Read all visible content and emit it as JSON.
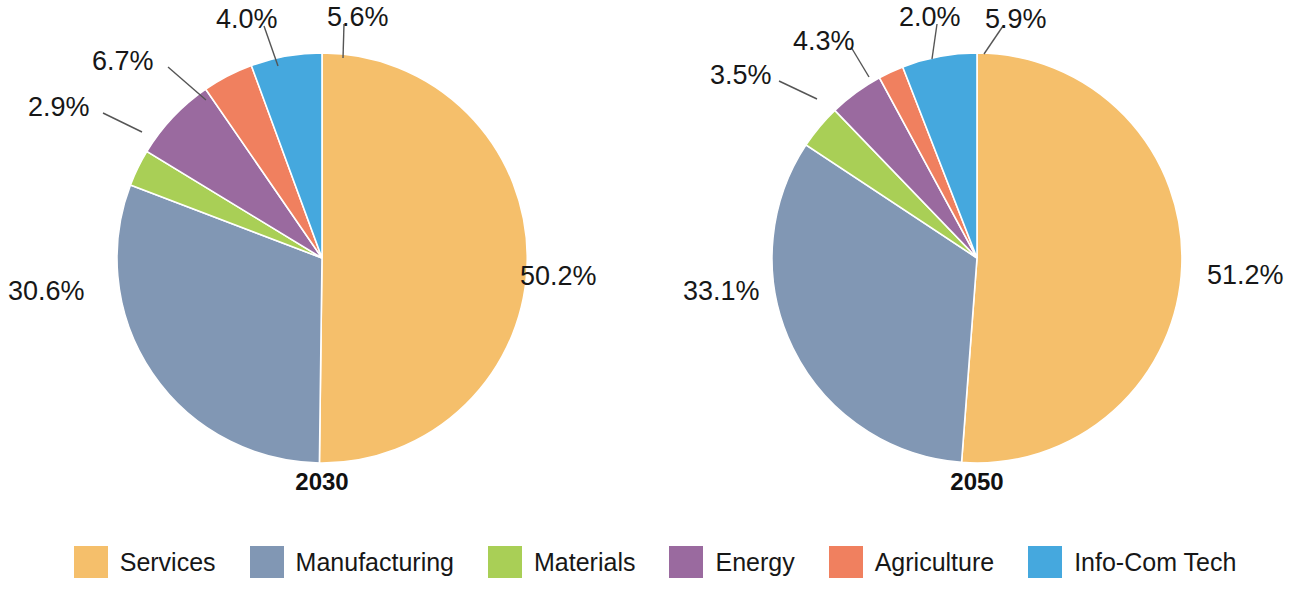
{
  "chart_data": [
    {
      "type": "pie",
      "title": "2030",
      "categories": [
        "Services",
        "Manufacturing",
        "Materials",
        "Energy",
        "Agriculture",
        "Info-Com Tech"
      ],
      "values": [
        50.2,
        30.6,
        2.9,
        6.7,
        4.0,
        5.6
      ],
      "value_labels": [
        "50.2%",
        "30.6%",
        "2.9%",
        "6.7%",
        "4.0%",
        "5.6%"
      ],
      "colors": [
        "#F5BF6B",
        "#8197B4",
        "#A9CF56",
        "#9A6A9F",
        "#F0805F",
        "#45A8DE"
      ],
      "legend_position": "bottom",
      "grid": false
    },
    {
      "type": "pie",
      "title": "2050",
      "categories": [
        "Services",
        "Manufacturing",
        "Materials",
        "Energy",
        "Agriculture",
        "Info-Com Tech"
      ],
      "values": [
        51.2,
        33.1,
        3.5,
        4.3,
        2.0,
        5.9
      ],
      "value_labels": [
        "51.2%",
        "33.1%",
        "3.5%",
        "4.3%",
        "2.0%",
        "5.9%"
      ],
      "colors": [
        "#F5BF6B",
        "#8197B4",
        "#A9CF56",
        "#9A6A9F",
        "#F0805F",
        "#45A8DE"
      ],
      "legend_position": "bottom",
      "grid": false
    }
  ],
  "charts": [
    {
      "year": "2030",
      "slices": [
        {
          "name": "Services",
          "label": "50.2%",
          "value": 50.2,
          "color": "#F5BF6B",
          "label_x": 520,
          "label_y": 263,
          "leader": false
        },
        {
          "name": "Manufacturing",
          "label": "30.6%",
          "value": 30.6,
          "color": "#8197B4",
          "label_x": 8,
          "label_y": 278,
          "leader": false
        },
        {
          "name": "Materials",
          "label": "2.9%",
          "value": 2.9,
          "color": "#A9CF56",
          "label_x": 28,
          "label_y": 94,
          "leader": true,
          "leader_x1": 103,
          "leader_y1": 113,
          "leader_x2": 142,
          "leader_y2": 132
        },
        {
          "name": "Energy",
          "label": "6.7%",
          "value": 6.7,
          "color": "#9A6A9F",
          "label_x": 92,
          "label_y": 48,
          "leader": true,
          "leader_x1": 168,
          "leader_y1": 67,
          "leader_x2": 206,
          "leader_y2": 100
        },
        {
          "name": "Agriculture",
          "label": "4.0%",
          "value": 4.0,
          "color": "#F0805F",
          "label_x": 216,
          "label_y": 6,
          "leader": true,
          "leader_x1": 264,
          "leader_y1": 26,
          "leader_x2": 278,
          "leader_y2": 66
        },
        {
          "name": "Info-Com Tech",
          "label": "5.6%",
          "value": 5.6,
          "color": "#45A8DE",
          "label_x": 327,
          "label_y": 4,
          "leader": true,
          "leader_x1": 344,
          "leader_y1": 24,
          "leader_x2": 343,
          "leader_y2": 58
        }
      ]
    },
    {
      "year": "2050",
      "slices": [
        {
          "name": "Services",
          "label": "51.2%",
          "value": 51.2,
          "color": "#F5BF6B",
          "label_x": 552,
          "label_y": 262,
          "leader": false
        },
        {
          "name": "Manufacturing",
          "label": "33.1%",
          "value": 33.1,
          "color": "#8197B4",
          "label_x": 28,
          "label_y": 278,
          "leader": false
        },
        {
          "name": "Materials",
          "label": "3.5%",
          "value": 3.5,
          "color": "#A9CF56",
          "label_x": 55,
          "label_y": 62,
          "leader": true,
          "leader_x1": 124,
          "leader_y1": 81,
          "leader_x2": 162,
          "leader_y2": 99
        },
        {
          "name": "Energy",
          "label": "4.3%",
          "value": 4.3,
          "color": "#9A6A9F",
          "label_x": 138,
          "label_y": 28,
          "leader": true,
          "leader_x1": 196,
          "leader_y1": 47,
          "leader_x2": 214,
          "leader_y2": 77
        },
        {
          "name": "Agriculture",
          "label": "2.0%",
          "value": 2.0,
          "color": "#F0805F",
          "label_x": 244,
          "label_y": 4,
          "leader": true,
          "leader_x1": 282,
          "leader_y1": 24,
          "leader_x2": 277,
          "leader_y2": 59
        },
        {
          "name": "Info-Com Tech",
          "label": "5.9%",
          "value": 5.9,
          "color": "#45A8DE",
          "label_x": 330,
          "label_y": 6,
          "leader": true,
          "leader_x1": 348,
          "leader_y1": 26,
          "leader_x2": 329,
          "leader_y2": 54
        }
      ]
    }
  ],
  "legend": {
    "items": [
      {
        "label": "Services",
        "color": "#F5BF6B"
      },
      {
        "label": "Manufacturing",
        "color": "#8197B4"
      },
      {
        "label": "Materials",
        "color": "#A9CF56"
      },
      {
        "label": "Energy",
        "color": "#9A6A9F"
      },
      {
        "label": "Agriculture",
        "color": "#F0805F"
      },
      {
        "label": "Info-Com Tech",
        "color": "#45A8DE"
      }
    ]
  },
  "geometry": {
    "cx": 322,
    "cy": 258,
    "r": 205,
    "start_angle": 0,
    "year_label_y": 470
  }
}
